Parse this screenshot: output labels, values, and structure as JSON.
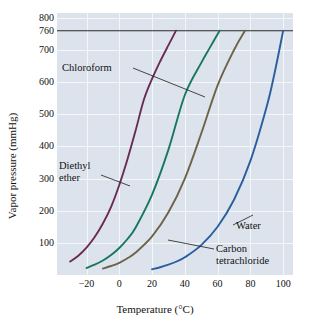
{
  "chart_data": {
    "type": "line",
    "title": "",
    "xlabel": "Temperature (°C)",
    "ylabel": "Vapor pressure (mmHg)",
    "xlim": [
      -38,
      106
    ],
    "ylim": [
      0,
      815
    ],
    "grid": true,
    "legend_position": "inline-annotations",
    "xticks": [
      -20,
      0,
      20,
      40,
      60,
      80,
      100
    ],
    "xticklabels": [
      "−20",
      "0",
      "20",
      "40",
      "60",
      "80",
      "100"
    ],
    "yticks": [
      100,
      200,
      300,
      400,
      500,
      600,
      700,
      760,
      800
    ],
    "yticklabels": [
      "100",
      "200",
      "300",
      "400",
      "500",
      "600",
      "700",
      "760",
      "800"
    ],
    "annotations": [
      {
        "text": "760 mmHg reference line",
        "y": 760,
        "kind": "hline"
      }
    ],
    "series": [
      {
        "name": "Diethyl ether",
        "color": "#6b2b57",
        "label": "Diethyl\nether",
        "boiling_point_c": 34.6,
        "x": [
          -30,
          -25,
          -20,
          -15,
          -10,
          -5,
          0,
          5,
          10,
          15,
          20,
          25,
          30,
          34.6
        ],
        "y": [
          42,
          60,
          85,
          118,
          160,
          212,
          280,
          360,
          450,
          545,
          610,
          665,
          715,
          760
        ]
      },
      {
        "name": "Chloroform",
        "color": "#18785f",
        "label": "Chloroform",
        "boiling_point_c": 61.2,
        "x": [
          -20,
          -15,
          -10,
          -5,
          0,
          5,
          10,
          20,
          30,
          40,
          50,
          55,
          61.2
        ],
        "y": [
          22,
          32,
          45,
          62,
          84,
          112,
          148,
          250,
          390,
          560,
          660,
          705,
          760
        ]
      },
      {
        "name": "Carbon tetrachloride",
        "color": "#6d6347",
        "label": "Carbon\ntetrachloride",
        "boiling_point_c": 76.7,
        "x": [
          -10,
          -5,
          0,
          5,
          10,
          20,
          30,
          40,
          50,
          60,
          70,
          76.7
        ],
        "y": [
          20,
          28,
          38,
          52,
          70,
          120,
          195,
          300,
          440,
          590,
          700,
          760
        ]
      },
      {
        "name": "Water",
        "color": "#2a5e9e",
        "label": "Water",
        "boiling_point_c": 100,
        "x": [
          20,
          25,
          30,
          35,
          40,
          50,
          60,
          70,
          80,
          90,
          95,
          100
        ],
        "y": [
          18,
          24,
          32,
          42,
          55,
          93,
          150,
          234,
          355,
          525,
          634,
          760
        ]
      }
    ]
  },
  "axes": {
    "y_title": "Vapor pressure (mmHg)",
    "x_title": "Temperature (°C)",
    "y_ticks": [
      "800",
      "760",
      "700",
      "600",
      "500",
      "400",
      "300",
      "200",
      "100"
    ],
    "x_ticks": [
      "−20",
      "0",
      "20",
      "40",
      "60",
      "80",
      "100"
    ]
  },
  "labels": {
    "chloroform": "Chloroform",
    "diethyl_line1": "Diethyl",
    "diethyl_line2": "ether",
    "water": "Water",
    "ccl4_line1": "Carbon",
    "ccl4_line2": "tetrachloride"
  },
  "colors": {
    "plot_background": "#dde3ec",
    "gridline": "#f4f7fa",
    "reference_line": "#2a2a2a",
    "diethyl_ether": "#6b2b57",
    "chloroform": "#18785f",
    "carbon_tetrachloride": "#6d6347",
    "water": "#2a5e9e"
  }
}
